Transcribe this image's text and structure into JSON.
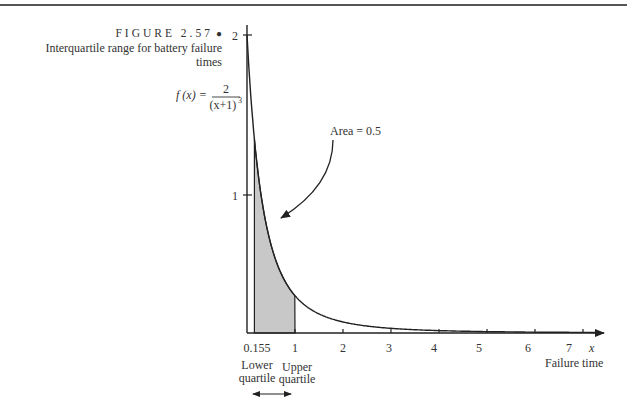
{
  "figure": {
    "label": "FIGURE 2.57",
    "marker": "●",
    "caption_line1": "Interquartile range for battery failure",
    "caption_line2": "times"
  },
  "chart_data": {
    "type": "area",
    "title": "Interquartile range for battery failure times",
    "function_label": "f(x) = 2/(x+1)^3",
    "function_lhs": "f (x) =",
    "function_num": "2",
    "function_den": "(x+1)",
    "function_exp": "3",
    "xlabel": "Failure time",
    "xvar": "x",
    "ylabel": "f(x)",
    "xlim": [
      0,
      7.3
    ],
    "ylim": [
      0,
      2
    ],
    "x_ticks": [
      "0.155",
      "1",
      "2",
      "3",
      "4",
      "5",
      "6",
      "7"
    ],
    "y_ticks": [
      "1",
      "2"
    ],
    "shaded_region": {
      "from": 0.155,
      "to": 1,
      "area": 0.5
    },
    "annotations": {
      "area": "Area = 0.5",
      "lower_quartile": [
        "Lower",
        "quartile"
      ],
      "upper_quartile": [
        "Upper",
        "quartile"
      ]
    },
    "series": [
      {
        "name": "f(x)",
        "x": [
          0,
          0.155,
          0.25,
          0.5,
          0.75,
          1,
          1.5,
          2,
          3,
          4,
          5,
          6,
          7
        ],
        "values": [
          2,
          1.298,
          1.024,
          0.593,
          0.373,
          0.25,
          0.128,
          0.074,
          0.031,
          0.016,
          0.009,
          0.006,
          0.004
        ]
      }
    ]
  }
}
